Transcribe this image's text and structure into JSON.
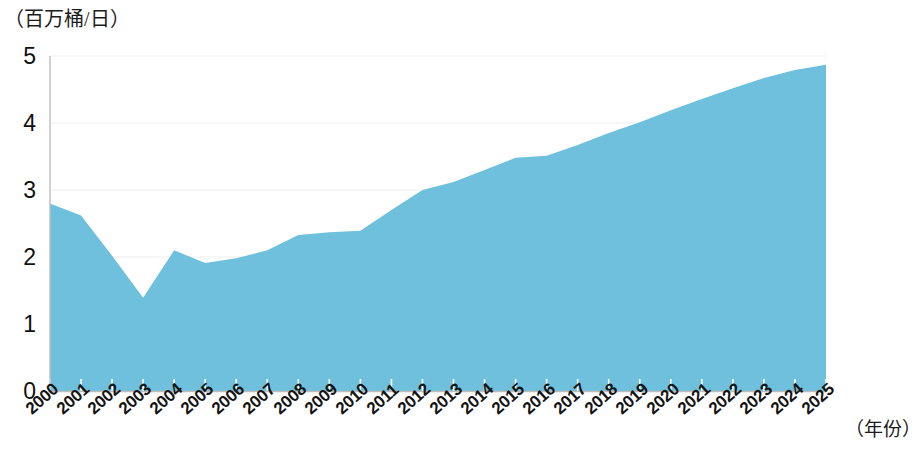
{
  "chart_data": {
    "type": "area",
    "title": "",
    "subtitle": "",
    "xlabel": "（年份）",
    "ylabel": "（百万桶/日）",
    "categories": [
      "2000",
      "2001",
      "2002",
      "2003",
      "2004",
      "2005",
      "2006",
      "2007",
      "2008",
      "2009",
      "2010",
      "2011",
      "2012",
      "2013",
      "2014",
      "2015",
      "2016",
      "2017",
      "2018",
      "2019",
      "2020",
      "2021",
      "2022",
      "2023",
      "2024",
      "2025"
    ],
    "values": [
      2.8,
      2.62,
      2.02,
      1.39,
      2.1,
      1.91,
      1.98,
      2.1,
      2.33,
      2.37,
      2.39,
      2.7,
      3.0,
      3.12,
      3.3,
      3.48,
      3.51,
      3.67,
      3.85,
      4.01,
      4.19,
      4.36,
      4.52,
      4.67,
      4.79,
      4.87
    ],
    "ylim": [
      0,
      5
    ],
    "yticks": [
      0,
      1,
      2,
      3,
      4,
      5
    ],
    "ytick_labels": [
      "0",
      "1",
      "2",
      "3",
      "4",
      "5"
    ],
    "xlim": [
      "2000",
      "2025"
    ],
    "grid": true,
    "legend": false,
    "legend_position": "none",
    "series": [
      {
        "name": "",
        "color": "#6FC0DC",
        "values": [
          2.8,
          2.62,
          2.02,
          1.39,
          2.1,
          1.91,
          1.98,
          2.1,
          2.33,
          2.37,
          2.39,
          2.7,
          3.0,
          3.12,
          3.3,
          3.48,
          3.51,
          3.67,
          3.85,
          4.01,
          4.19,
          4.36,
          4.52,
          4.67,
          4.79,
          4.87
        ]
      }
    ]
  },
  "colors": {
    "area_fill": "#6FC0DC",
    "gridline": "#EDEDED",
    "axis": "#B9B9B9",
    "text": "#141414",
    "background": "#FFFFFF"
  }
}
